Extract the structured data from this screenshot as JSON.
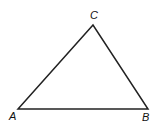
{
  "diagram": {
    "type": "triangle",
    "vertices": [
      {
        "label": "A",
        "x": 18,
        "y": 109
      },
      {
        "label": "B",
        "x": 148,
        "y": 109
      },
      {
        "label": "C",
        "x": 93,
        "y": 25
      }
    ],
    "stroke_color": "#222222"
  }
}
